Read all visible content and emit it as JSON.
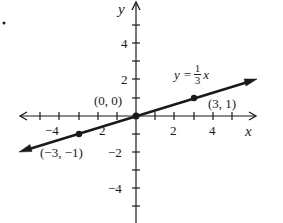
{
  "figure": {
    "axis_labels": {
      "x": "x",
      "y": "y"
    },
    "x_tick_labels": [
      {
        "value": -4,
        "text": "−4"
      },
      {
        "value": -2,
        "text": "2"
      },
      {
        "value": 2,
        "text": "2"
      },
      {
        "value": 4,
        "text": "4"
      }
    ],
    "y_tick_labels": [
      {
        "value": 4,
        "text": "4"
      },
      {
        "value": 2,
        "text": "2"
      },
      {
        "value": -2,
        "text": "−2"
      },
      {
        "value": -4,
        "text": "−4"
      }
    ],
    "equation": {
      "lhs": "y =",
      "num": "1",
      "den": "3",
      "var": "x"
    },
    "points": [
      {
        "label": "(0, 0)",
        "x": 0,
        "y": 0
      },
      {
        "label": "(3, 1)",
        "x": 3,
        "y": 1
      },
      {
        "label": "(−3, −1)",
        "x": -3,
        "y": -1
      }
    ],
    "colors": {
      "ink": "#1a1a1a",
      "background": "#ffffff"
    }
  }
}
